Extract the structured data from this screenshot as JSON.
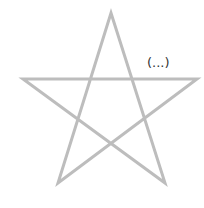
{
  "diagram": {
    "shape": "pentagram",
    "stroke_color": "#bdbdbd",
    "stroke_width": 3,
    "points": [
      [
        111,
        13
      ],
      [
        165,
        183
      ],
      [
        23,
        79
      ],
      [
        197,
        79
      ],
      [
        58,
        183
      ]
    ],
    "annotation": "(...)"
  }
}
